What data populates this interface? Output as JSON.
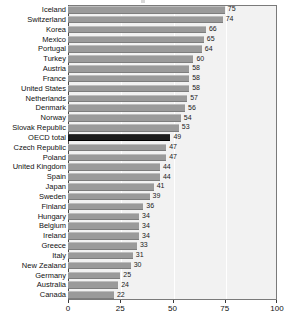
{
  "chart_data": {
    "type": "bar",
    "orientation": "horizontal",
    "title": "",
    "subtitle": "",
    "xlabel": "",
    "ylabel": "",
    "xlim": [
      0,
      100
    ],
    "xticks": [
      0,
      25,
      50,
      75,
      100
    ],
    "xtick_labels": [
      "0",
      "25",
      "50",
      "75",
      "100"
    ],
    "grid": true,
    "grid_axis": "x",
    "legend": "none",
    "highlight_category": "OECD total",
    "bar_color": "#9a9a9a",
    "highlight_color": "#1c1c1c",
    "plot_background": "#f2f2f2",
    "gridline_color": "#ffffff",
    "categories": [
      "Iceland",
      "Switzerland",
      "Korea",
      "Mexico",
      "Portugal",
      "Turkey",
      "Austria",
      "France",
      "United States",
      "Netherlands",
      "Denmark",
      "Norway",
      "Slovak Republic",
      "OECD total",
      "Czech Republic",
      "Poland",
      "United Kingdom",
      "Spain",
      "Japan",
      "Sweden",
      "Finland",
      "Hungary",
      "Belgium",
      "Ireland",
      "Greece",
      "Italy",
      "New Zealand",
      "Germany",
      "Australia",
      "Canada"
    ],
    "values": [
      75,
      74,
      66,
      65,
      64,
      60,
      58,
      58,
      58,
      57,
      56,
      54,
      53,
      49,
      47,
      47,
      44,
      44,
      41,
      39,
      36,
      34,
      34,
      34,
      33,
      31,
      30,
      25,
      24,
      22
    ],
    "data_labels": [
      "75",
      "74",
      "66",
      "65",
      "64",
      "60",
      "58",
      "58",
      "58",
      "57",
      "56",
      "54",
      "53",
      "49",
      "47",
      "47",
      "44",
      "44",
      "41",
      "39",
      "36",
      "34",
      "34",
      "34",
      "33",
      "31",
      "30",
      "25",
      "24",
      "22"
    ]
  }
}
